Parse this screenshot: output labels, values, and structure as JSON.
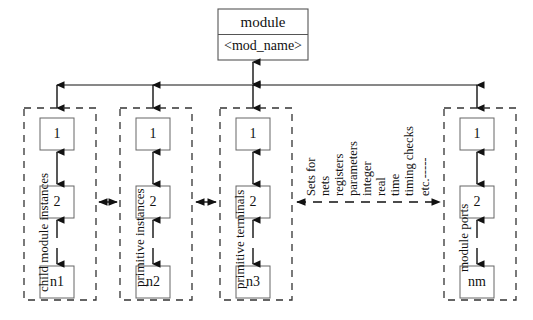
{
  "diagram": {
    "title_box": {
      "title": "module",
      "name": "<mod_name>"
    },
    "groups": [
      {
        "id": "child-module-instances",
        "label": "child module instances",
        "cells": [
          "1",
          "2",
          "n1"
        ]
      },
      {
        "id": "primitive-instances",
        "label": "primitive instances",
        "cells": [
          "1",
          "2",
          "n2"
        ]
      },
      {
        "id": "primitive-terminals",
        "label": "primitive terminals",
        "cells": [
          "1",
          "2",
          "n3"
        ]
      },
      {
        "id": "module-ports",
        "label": "module ports",
        "cells": [
          "1",
          "2",
          "nm"
        ]
      }
    ],
    "set_labels": [
      "Sets for",
      "nets",
      "registers",
      "parameters",
      "integer",
      "real",
      "time",
      "timing checks",
      "etc.-----"
    ],
    "colors": {
      "stroke": "#111111",
      "box_stroke": "#555555",
      "dashed_stroke": "#333333",
      "background": "#ffffff"
    }
  }
}
